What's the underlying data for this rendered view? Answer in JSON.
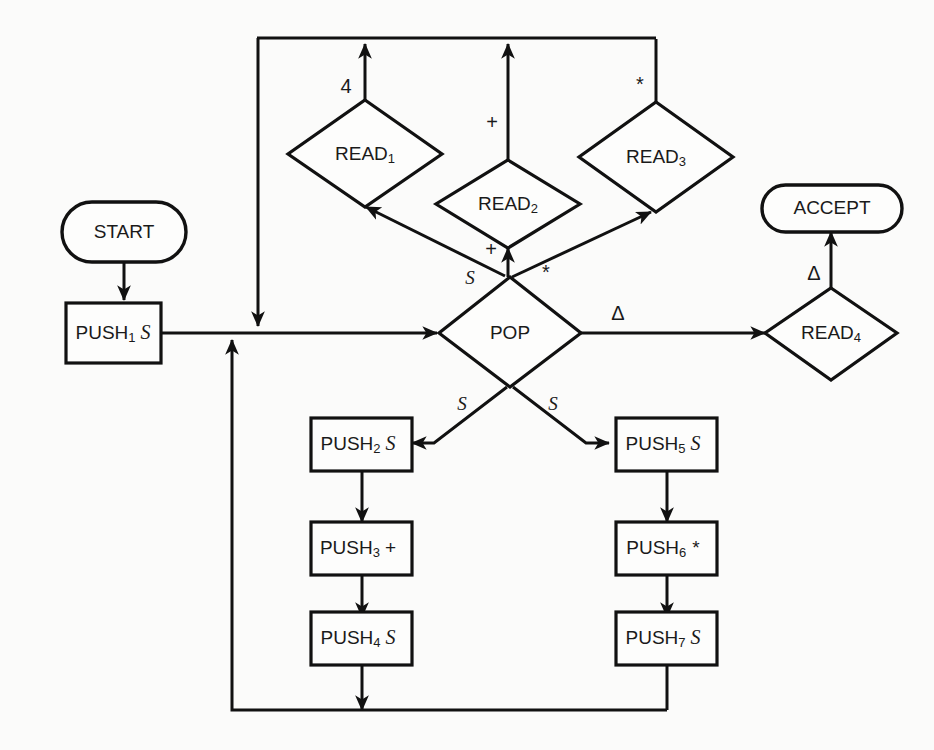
{
  "diagram": {
    "type": "flowchart",
    "nodes": [
      {
        "id": "start",
        "shape": "oval",
        "label": "START",
        "sub": "",
        "operand": ""
      },
      {
        "id": "push1",
        "shape": "rect",
        "label": "PUSH",
        "sub": "1",
        "operand": "S"
      },
      {
        "id": "read1",
        "shape": "diamond",
        "label": "READ",
        "sub": "1",
        "operand": ""
      },
      {
        "id": "read2",
        "shape": "diamond",
        "label": "READ",
        "sub": "2",
        "operand": ""
      },
      {
        "id": "read3",
        "shape": "diamond",
        "label": "READ",
        "sub": "3",
        "operand": ""
      },
      {
        "id": "read4",
        "shape": "diamond",
        "label": "READ",
        "sub": "4",
        "operand": ""
      },
      {
        "id": "pop",
        "shape": "diamond",
        "label": "POP",
        "sub": "",
        "operand": ""
      },
      {
        "id": "accept",
        "shape": "oval",
        "label": "ACCEPT",
        "sub": "",
        "operand": ""
      },
      {
        "id": "push2",
        "shape": "rect",
        "label": "PUSH",
        "sub": "2",
        "operand": "S"
      },
      {
        "id": "push3",
        "shape": "rect",
        "label": "PUSH",
        "sub": "3",
        "operand": "+"
      },
      {
        "id": "push4",
        "shape": "rect",
        "label": "PUSH",
        "sub": "4",
        "operand": "S"
      },
      {
        "id": "push5",
        "shape": "rect",
        "label": "PUSH",
        "sub": "5",
        "operand": "S"
      },
      {
        "id": "push6",
        "shape": "rect",
        "label": "PUSH",
        "sub": "6",
        "operand": "*"
      },
      {
        "id": "push7",
        "shape": "rect",
        "label": "PUSH",
        "sub": "7",
        "operand": "S"
      }
    ],
    "edge_labels": {
      "read1_top": "4",
      "read2_top": "+",
      "read3_top": "*",
      "pop_to_read1": "S",
      "pop_to_read2": "+",
      "pop_to_read3": "*",
      "pop_to_read4": "Δ",
      "pop_to_push2": "S",
      "pop_to_push5": "S",
      "read4_to_accept": "Δ"
    },
    "colors": {
      "stroke": "#111111",
      "fill": "#fdfdfc",
      "background": "#fbfbfa",
      "text": "#1a1a1a"
    }
  }
}
